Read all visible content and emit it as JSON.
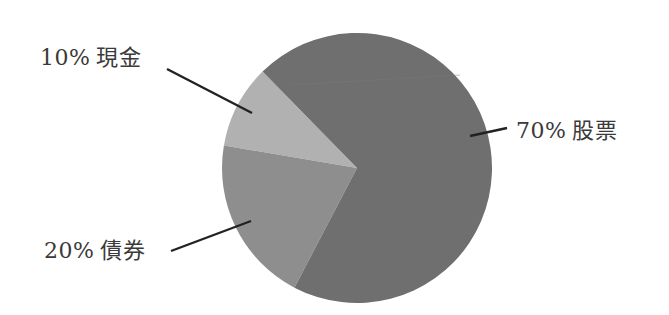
{
  "chart_data": {
    "type": "pie",
    "title": "",
    "slices": [
      {
        "name": "現金",
        "value": 10,
        "label": "10% 現金",
        "color": "#b1b1b1"
      },
      {
        "name": "債券",
        "value": 20,
        "label": "20% 債券",
        "color": "#8e8e8e"
      },
      {
        "name": "股票",
        "value": 70,
        "label": "70% 股票",
        "color": "#6f6f6f"
      }
    ],
    "categories": [
      "現金",
      "債券",
      "股票"
    ],
    "values": [
      10,
      20,
      70
    ],
    "legend": "none",
    "labels_position": "outside-with-leader-lines"
  },
  "labels": {
    "cash": {
      "pct": "10%",
      "text": "現金"
    },
    "bonds": {
      "pct": "20%",
      "text": "債券"
    },
    "stocks": {
      "pct": "70%",
      "text": "股票"
    }
  },
  "colors": {
    "cash": "#b1b1b1",
    "bonds": "#8e8e8e",
    "stocks": "#6f6f6f",
    "leader": "#222222",
    "text": "#3a3a3a"
  }
}
